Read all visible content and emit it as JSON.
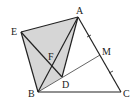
{
  "diagram": {
    "type": "geometry",
    "points": {
      "A": {
        "label": "A",
        "x": 78,
        "y": 17
      },
      "B": {
        "label": "B",
        "x": 38,
        "y": 92
      },
      "C": {
        "label": "C",
        "x": 121,
        "y": 92
      },
      "D": {
        "label": "D",
        "x": 62,
        "y": 77
      },
      "E": {
        "label": "E",
        "x": 21,
        "y": 32
      },
      "F": {
        "label": "F",
        "x": 51,
        "y": 63
      },
      "M": {
        "label": "M",
        "x": 100,
        "y": 55
      }
    },
    "shaded_region": [
      "E",
      "A",
      "D",
      "B"
    ],
    "segments": [
      "AB",
      "AC",
      "BC",
      "AE",
      "EB",
      "ED",
      "AD",
      "BM"
    ],
    "equal_marks": [
      "AM",
      "MC"
    ],
    "colors": {
      "stroke": "#222222",
      "fill": "#d6d6d6"
    }
  }
}
